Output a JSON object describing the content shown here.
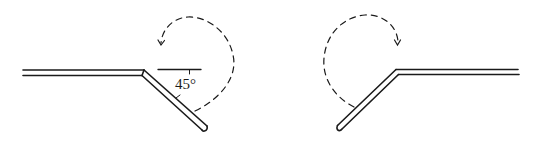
{
  "diagram": {
    "colors": {
      "line": "#1a1a1a",
      "background": "#ffffff"
    },
    "left_figure": {
      "angle_label": "45°",
      "rotation": "counterclockwise"
    },
    "right_figure": {
      "rotation": "clockwise"
    }
  }
}
